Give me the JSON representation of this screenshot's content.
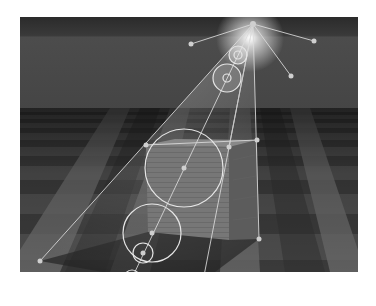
{
  "scene": {
    "description": "3D render: wooden crate on checkerboard floor lit by a spotlight, with lens flare and light gizmo overlay",
    "frame": {
      "x": 20,
      "y": 17,
      "w": 338,
      "h": 255
    },
    "colors": {
      "sky_top": "#2e2e2e",
      "sky_band": "#4a4a4a",
      "horizon": "#3c3c3c",
      "floor_dark": "#3a3a3a",
      "floor_light": "#6e6e6e",
      "crate_front": "#767676",
      "crate_side": "#5a5a5a",
      "crate_top": "#8a8a8a",
      "shadow": "#2c2c2c",
      "gizmo_line": "#d8d8d8",
      "gizmo_point": "#cfcfcf",
      "flare": "#ffffff"
    },
    "light_source": {
      "x": 253,
      "y": 24
    },
    "gizmo_points": [
      {
        "x": 253,
        "y": 24
      },
      {
        "x": 191,
        "y": 44
      },
      {
        "x": 314,
        "y": 41
      },
      {
        "x": 291,
        "y": 76
      },
      {
        "x": 146,
        "y": 145
      },
      {
        "x": 229,
        "y": 147
      },
      {
        "x": 257,
        "y": 140
      },
      {
        "x": 40,
        "y": 261
      },
      {
        "x": 203,
        "y": 281
      },
      {
        "x": 259,
        "y": 239
      }
    ],
    "flare_rings": [
      {
        "x": 238,
        "y": 55,
        "r": 7,
        "core": 3
      },
      {
        "x": 227,
        "y": 78,
        "r": 14,
        "core": 3
      },
      {
        "x": 184,
        "y": 168,
        "r": 39,
        "core": 3
      },
      {
        "x": 152,
        "y": 233,
        "r": 29,
        "core": 3
      },
      {
        "x": 143,
        "y": 253,
        "r": 10,
        "core": 3
      },
      {
        "x": 132,
        "y": 278,
        "r": 8,
        "core": 3
      }
    ]
  }
}
